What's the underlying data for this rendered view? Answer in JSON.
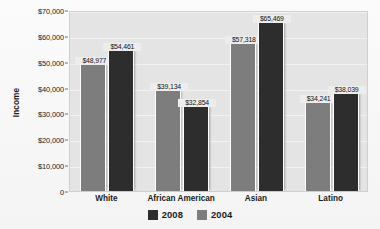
{
  "chart_data": {
    "type": "bar",
    "title": "",
    "xlabel": "",
    "ylabel": "Income",
    "ylim": [
      0,
      70000
    ],
    "ytick_values": [
      70000,
      60000,
      50000,
      40000,
      30000,
      20000,
      10000,
      0
    ],
    "ytick_labels": [
      "$70,000",
      "$60,000",
      "$50,000",
      "$40,000",
      "$30,000",
      "$20,000",
      "$10,000",
      "0"
    ],
    "categories": [
      "White",
      "African American",
      "Asian",
      "Latino"
    ],
    "grid": true,
    "legend_position": "bottom-center",
    "series": [
      {
        "name": "2008",
        "color": "#2d2d2d",
        "values": [
          54461,
          32854,
          65469,
          38039
        ],
        "value_labels": [
          "$54,461",
          "$32,854",
          "$65,469",
          "$38,039"
        ]
      },
      {
        "name": "2004",
        "color": "#7d7d7d",
        "values": [
          48977,
          39134,
          57318,
          34241
        ],
        "value_labels": [
          "$48,977",
          "$39,134",
          "$57,318",
          "$34,241"
        ]
      }
    ],
    "bar_draw_order": [
      "2004",
      "2008"
    ],
    "legend_order": [
      "2008",
      "2004"
    ]
  },
  "colors": {
    "plot_background": "#e4e4e4",
    "gridline": "#f2f2f2",
    "axis_text": "#1a1a1a",
    "series_2008": "#2d2d2d",
    "series_2004": "#7d7d7d"
  }
}
